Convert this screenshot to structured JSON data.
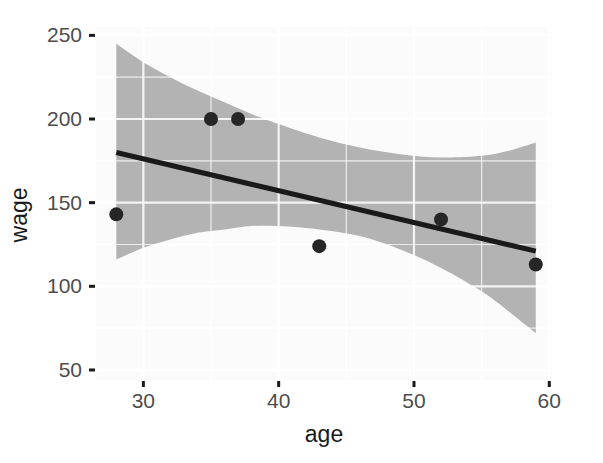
{
  "chart_data": {
    "type": "scatter",
    "title": "",
    "subtitle": "",
    "xlabel": "age",
    "ylabel": "wage",
    "xlim": [
      26.5,
      60.2
    ],
    "ylim": [
      44,
      255
    ],
    "xticks": [
      30,
      40,
      50,
      60
    ],
    "yticks": [
      50,
      100,
      150,
      200,
      250
    ],
    "xtick_labels": [
      "30",
      "40",
      "50",
      "60"
    ],
    "ytick_labels": [
      "50",
      "100",
      "150",
      "200",
      "250"
    ],
    "grid": true,
    "grid_major_color": "#ffffff",
    "grid_minor_color": "#ffffff",
    "panel_background": "#fbfbfb",
    "legend": null,
    "legend_position": "none",
    "points": [
      {
        "x": 28,
        "y": 143
      },
      {
        "x": 35,
        "y": 200
      },
      {
        "x": 37,
        "y": 200
      },
      {
        "x": 43,
        "y": 124
      },
      {
        "x": 52,
        "y": 140
      },
      {
        "x": 59,
        "y": 113
      }
    ],
    "point_color": "#262626",
    "point_size": 7,
    "series": [
      {
        "name": "linear fit",
        "type": "line",
        "color": "#1a1a1a",
        "x": [
          28,
          59
        ],
        "y": [
          180,
          121
        ]
      }
    ],
    "confidence_band": {
      "name": "95% confidence interval",
      "fill_color": "#b3b3b3",
      "x": [
        28,
        30,
        32,
        34,
        36,
        38,
        40,
        43,
        46,
        49,
        52,
        55,
        57,
        59
      ],
      "upper": [
        245,
        234,
        225,
        217,
        210,
        203,
        197,
        189,
        183,
        179,
        177,
        178,
        181,
        186
      ],
      "lower": [
        116,
        123,
        128,
        132,
        134,
        136,
        136,
        134,
        130,
        122,
        111,
        97,
        85,
        72
      ]
    }
  },
  "axis": {
    "tick_color": "#1a1a1a",
    "label_color": "#4d4d4d",
    "title_color": "#1a1a1a"
  }
}
